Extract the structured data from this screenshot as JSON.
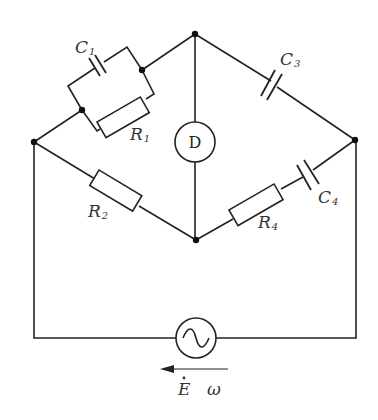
{
  "diagram": {
    "type": "AC bridge circuit",
    "components": {
      "C1": {
        "label": "C",
        "sub": "1"
      },
      "R1": {
        "label": "R",
        "sub": "1"
      },
      "C3": {
        "label": "C",
        "sub": "3"
      },
      "R2": {
        "label": "R",
        "sub": "2"
      },
      "R4": {
        "label": "R",
        "sub": "4"
      },
      "C4": {
        "label": "C",
        "sub": "4"
      },
      "detector": {
        "label": "D"
      },
      "source": {
        "emf_label": "E",
        "freq_label": "ω"
      }
    }
  }
}
